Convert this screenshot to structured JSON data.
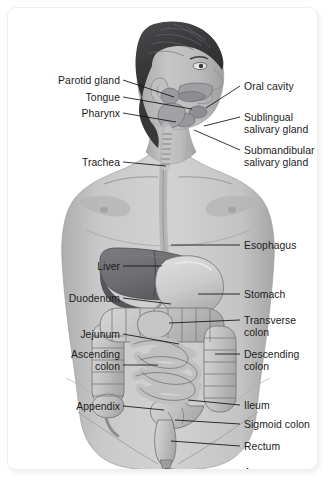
{
  "figure": {
    "background_color": "#ffffff",
    "card_border_color": "#efefef",
    "leader_line_color": "#111111",
    "label_text_color": "#1c1c1c",
    "palette": {
      "hair": "#3c3c3e",
      "hair_highlight": "#6a6a6c",
      "skin": "#b9b9b9",
      "skin_shadow": "#9d9d9d",
      "skin_light": "#cfcfcf",
      "body_fill": "#c9c9c9",
      "liver": "#6f6f73",
      "liver_shadow": "#5a5a5e",
      "stomach": "#cfcfcf",
      "intestine": "#c4c4c4",
      "intestine_outline": "#6d6d6d",
      "tube": "#bdbdbd",
      "outline": "#5a5a5a"
    }
  },
  "labels_left": [
    {
      "id": "parotid-gland",
      "text": "Parotid gland",
      "x": 112,
      "y": 67
    },
    {
      "id": "tongue",
      "text": "Tongue",
      "x": 112,
      "y": 84
    },
    {
      "id": "pharynx",
      "text": "Pharynx",
      "x": 112,
      "y": 100
    },
    {
      "id": "trachea",
      "text": "Trachea",
      "x": 112,
      "y": 149
    },
    {
      "id": "liver",
      "text": "Liver",
      "x": 112,
      "y": 253
    },
    {
      "id": "duodenum",
      "text": "Duodenum",
      "x": 112,
      "y": 285
    },
    {
      "id": "jejunum",
      "text": "Jejunum",
      "x": 112,
      "y": 321
    },
    {
      "id": "ascending-colon",
      "text": "Ascending\ncolon",
      "x": 112,
      "y": 341
    },
    {
      "id": "appendix",
      "text": "Appendix",
      "x": 112,
      "y": 393
    }
  ],
  "labels_right": [
    {
      "id": "oral-cavity",
      "text": "Oral cavity",
      "x": 236,
      "y": 73
    },
    {
      "id": "sublingual-salivary-gland",
      "text": "Sublingual\nsalivary gland",
      "x": 236,
      "y": 104
    },
    {
      "id": "submandibular-salivary-gland",
      "text": "Submandibular\nsalivary gland",
      "x": 236,
      "y": 137
    },
    {
      "id": "esophagus",
      "text": "Esophagus",
      "x": 236,
      "y": 232
    },
    {
      "id": "stomach",
      "text": "Stomach",
      "x": 236,
      "y": 281
    },
    {
      "id": "transverse-colon",
      "text": "Transverse\ncolon",
      "x": 236,
      "y": 307
    },
    {
      "id": "descending-colon",
      "text": "Descending\ncolon",
      "x": 236,
      "y": 341
    },
    {
      "id": "ileum",
      "text": "Ileum",
      "x": 236,
      "y": 392
    },
    {
      "id": "sigmoid-colon",
      "text": "Sigmoid colon",
      "x": 236,
      "y": 411
    },
    {
      "id": "rectum",
      "text": "Rectum",
      "x": 236,
      "y": 433
    },
    {
      "id": "anus",
      "text": "Anus",
      "x": 236,
      "y": 459
    }
  ],
  "leader_lines_left": [
    {
      "id": "parotid-gland",
      "x1": 115,
      "y1": 72,
      "x2": 166,
      "y2": 89
    },
    {
      "id": "tongue",
      "x1": 115,
      "y1": 89,
      "x2": 184,
      "y2": 101
    },
    {
      "id": "pharynx",
      "x1": 115,
      "y1": 105,
      "x2": 168,
      "y2": 114
    },
    {
      "id": "trachea",
      "x1": 115,
      "y1": 154,
      "x2": 158,
      "y2": 158
    },
    {
      "id": "liver",
      "x1": 115,
      "y1": 258,
      "x2": 154,
      "y2": 258
    },
    {
      "id": "duodenum",
      "x1": 115,
      "y1": 290,
      "x2": 163,
      "y2": 296
    },
    {
      "id": "jejunum",
      "x1": 115,
      "y1": 326,
      "x2": 171,
      "y2": 336
    },
    {
      "id": "ascending-colon",
      "x1": 115,
      "y1": 357,
      "x2": 150,
      "y2": 357
    },
    {
      "id": "appendix",
      "x1": 115,
      "y1": 398,
      "x2": 156,
      "y2": 402
    }
  ],
  "leader_lines_right": [
    {
      "id": "oral-cavity",
      "x1": 232,
      "y1": 78,
      "x2": 198,
      "y2": 100
    },
    {
      "id": "sublingual-salivary-gland",
      "x1": 232,
      "y1": 109,
      "x2": 196,
      "y2": 118
    },
    {
      "id": "submandibular-salivary-gland",
      "x1": 232,
      "y1": 142,
      "x2": 186,
      "y2": 122
    },
    {
      "id": "esophagus",
      "x1": 232,
      "y1": 237,
      "x2": 163,
      "y2": 237
    },
    {
      "id": "stomach",
      "x1": 232,
      "y1": 286,
      "x2": 190,
      "y2": 286
    },
    {
      "id": "transverse-colon",
      "x1": 232,
      "y1": 312,
      "x2": 161,
      "y2": 315
    },
    {
      "id": "descending-colon",
      "x1": 232,
      "y1": 346,
      "x2": 207,
      "y2": 346
    },
    {
      "id": "ileum",
      "x1": 232,
      "y1": 397,
      "x2": 180,
      "y2": 392
    },
    {
      "id": "sigmoid-colon",
      "x1": 232,
      "y1": 416,
      "x2": 167,
      "y2": 412
    },
    {
      "id": "rectum",
      "x1": 232,
      "y1": 438,
      "x2": 163,
      "y2": 433
    },
    {
      "id": "anus",
      "x1": 232,
      "y1": 464,
      "x2": 157,
      "y2": 461
    }
  ]
}
